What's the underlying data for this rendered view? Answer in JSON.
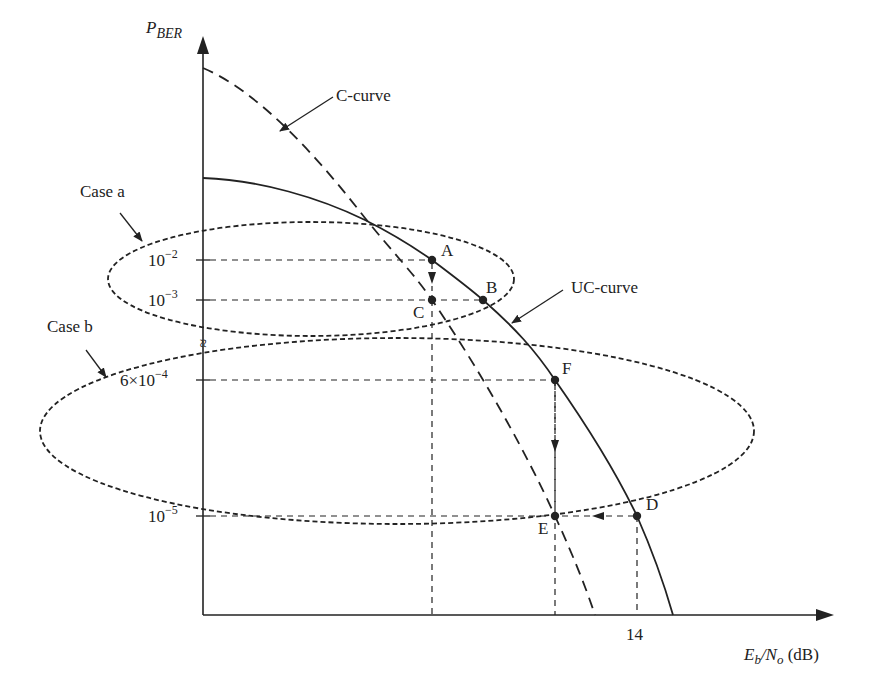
{
  "diagram": {
    "y_axis": {
      "label_main": "P",
      "label_sub": "BER"
    },
    "x_axis": {
      "label_E": "E",
      "label_b": "b",
      "label_slash_N": "/N",
      "label_o": "o",
      "label_unit": " (dB)",
      "tick_14": "14"
    },
    "y_ticks": {
      "t1": {
        "base": "10",
        "exp": "−2"
      },
      "t2": {
        "base": "10",
        "exp": "−3"
      },
      "t3": {
        "base": "6×10",
        "exp": "−4"
      },
      "t4": {
        "base": "10",
        "exp": "−5"
      }
    },
    "axis_break": "≈",
    "curves": {
      "c_curve": "C-curve",
      "uc_curve": "UC-curve"
    },
    "cases": {
      "case_a": "Case a",
      "case_b": "Case b"
    },
    "points": {
      "A": "A",
      "B": "B",
      "C": "C",
      "D": "D",
      "E": "E",
      "F": "F"
    },
    "colors": {
      "ink": "#222222",
      "background": "#ffffff"
    }
  }
}
